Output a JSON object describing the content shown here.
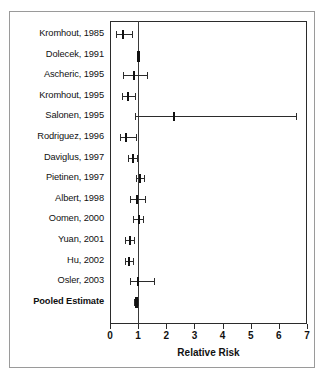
{
  "figure": {
    "title": "",
    "axis_title": "Relative Risk",
    "reference_value": 1
  },
  "chart_data": {
    "type": "scatter",
    "title": "",
    "subtitle": "",
    "xlabel": "Relative Risk",
    "ylabel": "",
    "xlim": [
      0,
      7
    ],
    "xticks": [
      0,
      1,
      2,
      3,
      4,
      5,
      6,
      7
    ],
    "xtick_labels": [
      "0",
      "1",
      "2",
      "3",
      "4",
      "5",
      "6",
      "7"
    ],
    "grid": false,
    "legend": null,
    "reference_line": 1,
    "categories": [
      "Kromhout, 1985",
      "Dolecek, 1991",
      "Ascheric, 1995",
      "Kromhout, 1995",
      "Salonen, 1995",
      "Rodriguez, 1996",
      "Daviglus, 1997",
      "Pietinen, 1997",
      "Albert, 1998",
      "Oomen, 2000",
      "Yuan, 2001",
      "Hu, 2002",
      "Osler, 2003",
      "Pooled Estimate"
    ],
    "values": [
      0.46,
      1.0,
      0.86,
      0.64,
      2.28,
      0.57,
      0.82,
      1.07,
      0.96,
      1.03,
      0.71,
      0.68,
      1.0,
      0.93
    ],
    "ci_low": [
      0.21,
      0.97,
      0.45,
      0.43,
      0.9,
      0.36,
      0.64,
      0.93,
      0.71,
      0.82,
      0.53,
      0.53,
      0.72,
      0.85
    ],
    "ci_high": [
      0.78,
      1.03,
      1.3,
      0.88,
      6.6,
      0.92,
      0.96,
      1.2,
      1.25,
      1.17,
      0.86,
      0.81,
      1.56,
      1.0
    ],
    "rows": [
      {
        "label": "Kromhout, 1985",
        "estimate": 0.46,
        "ci_low": 0.21,
        "ci_high": 0.78,
        "pooled": false
      },
      {
        "label": "Dolecek, 1991",
        "estimate": 1.0,
        "ci_low": 0.97,
        "ci_high": 1.03,
        "pooled": false
      },
      {
        "label": "Ascheric, 1995",
        "estimate": 0.86,
        "ci_low": 0.45,
        "ci_high": 1.3,
        "pooled": false
      },
      {
        "label": "Kromhout, 1995",
        "estimate": 0.64,
        "ci_low": 0.43,
        "ci_high": 0.88,
        "pooled": false
      },
      {
        "label": "Salonen, 1995",
        "estimate": 2.28,
        "ci_low": 0.9,
        "ci_high": 6.6,
        "pooled": false
      },
      {
        "label": "Rodriguez, 1996",
        "estimate": 0.57,
        "ci_low": 0.36,
        "ci_high": 0.92,
        "pooled": false
      },
      {
        "label": "Daviglus, 1997",
        "estimate": 0.82,
        "ci_low": 0.64,
        "ci_high": 0.96,
        "pooled": false
      },
      {
        "label": "Pietinen, 1997",
        "estimate": 1.07,
        "ci_low": 0.93,
        "ci_high": 1.2,
        "pooled": false
      },
      {
        "label": "Albert, 1998",
        "estimate": 0.96,
        "ci_low": 0.71,
        "ci_high": 1.25,
        "pooled": false
      },
      {
        "label": "Oomen, 2000",
        "estimate": 1.03,
        "ci_low": 0.82,
        "ci_high": 1.17,
        "pooled": false
      },
      {
        "label": "Yuan, 2001",
        "estimate": 0.71,
        "ci_low": 0.53,
        "ci_high": 0.86,
        "pooled": false
      },
      {
        "label": "Hu, 2002",
        "estimate": 0.68,
        "ci_low": 0.53,
        "ci_high": 0.81,
        "pooled": false
      },
      {
        "label": "Osler, 2003",
        "estimate": 1.0,
        "ci_low": 0.72,
        "ci_high": 1.56,
        "pooled": false
      },
      {
        "label": "Pooled Estimate",
        "estimate": 0.93,
        "ci_low": 0.85,
        "ci_high": 1.0,
        "pooled": true
      }
    ]
  },
  "colors": {
    "marker": "#111111",
    "line": "#2b2b2b",
    "frame": "#9a9a9a",
    "background": "#ffffff"
  }
}
